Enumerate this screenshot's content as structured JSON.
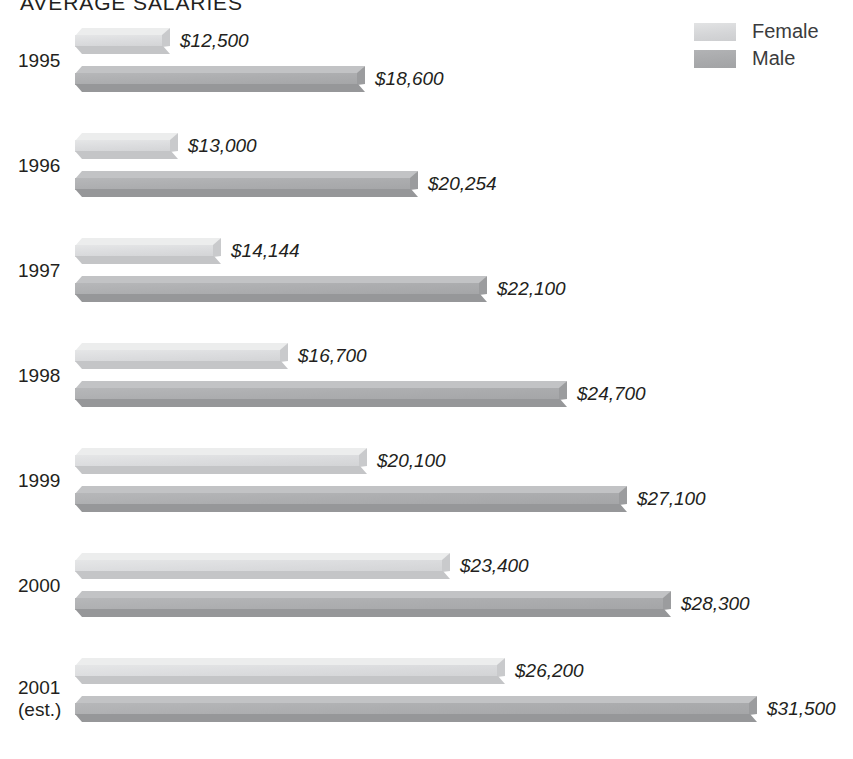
{
  "header": {
    "title": "AVERAGE SALARIES"
  },
  "legend": {
    "position": "top-right",
    "items": [
      {
        "label": "Female",
        "color": "#d9dadc",
        "key": "female"
      },
      {
        "label": "Male",
        "color": "#adaeb0",
        "key": "male"
      }
    ]
  },
  "colors": {
    "female": "#d9dadc",
    "male": "#adaeb0",
    "text": "#231f20",
    "background": "#ffffff"
  },
  "chart_data": {
    "type": "bar",
    "orientation": "horizontal",
    "title": "AVERAGE SALARIES",
    "xlabel": "",
    "ylabel": "",
    "grid": false,
    "legend_position": "top-right",
    "categories": [
      "1995",
      "1996",
      "1997",
      "1998",
      "1999",
      "2000",
      "2001 (est.)"
    ],
    "series": [
      {
        "name": "Female",
        "color": "#d9dadc",
        "values": [
          12500,
          13000,
          14144,
          16700,
          20100,
          23400,
          26200
        ],
        "labels": [
          "$12,500",
          "$13,000",
          "$14,144",
          "$16,700",
          "$20,100",
          "$23,400",
          "$26,200"
        ]
      },
      {
        "name": "Male",
        "color": "#adaeb0",
        "values": [
          18600,
          20254,
          22100,
          24700,
          27100,
          28300,
          31500
        ],
        "labels": [
          "$18,600",
          "$20,254",
          "$22,100",
          "$24,700",
          "$27,100",
          "$28,300",
          "$31,500"
        ]
      }
    ]
  },
  "groups": [
    {
      "year": "1995",
      "year_line2": "",
      "female": {
        "label": "$12,500",
        "value": 12500,
        "bar_px": 95
      },
      "male": {
        "label": "$18,600",
        "value": 18600,
        "bar_px": 290
      }
    },
    {
      "year": "1996",
      "year_line2": "",
      "female": {
        "label": "$13,000",
        "value": 13000,
        "bar_px": 103
      },
      "male": {
        "label": "$20,254",
        "value": 20254,
        "bar_px": 343
      }
    },
    {
      "year": "1997",
      "year_line2": "",
      "female": {
        "label": "$14,144",
        "value": 14144,
        "bar_px": 146
      },
      "male": {
        "label": "$22,100",
        "value": 22100,
        "bar_px": 412
      }
    },
    {
      "year": "1998",
      "year_line2": "",
      "female": {
        "label": "$16,700",
        "value": 16700,
        "bar_px": 213
      },
      "male": {
        "label": "$24,700",
        "value": 24700,
        "bar_px": 492
      }
    },
    {
      "year": "1999",
      "year_line2": "",
      "female": {
        "label": "$20,100",
        "value": 20100,
        "bar_px": 292
      },
      "male": {
        "label": "$27,100",
        "value": 27100,
        "bar_px": 552
      }
    },
    {
      "year": "2000",
      "year_line2": "",
      "female": {
        "label": "$23,400",
        "value": 23400,
        "bar_px": 375
      },
      "male": {
        "label": "$28,300",
        "value": 28300,
        "bar_px": 596
      }
    },
    {
      "year": "2001",
      "year_line2": "(est.)",
      "female": {
        "label": "$26,200",
        "value": 26200,
        "bar_px": 430
      },
      "male": {
        "label": "$31,500",
        "value": 31500,
        "bar_px": 682
      }
    }
  ]
}
